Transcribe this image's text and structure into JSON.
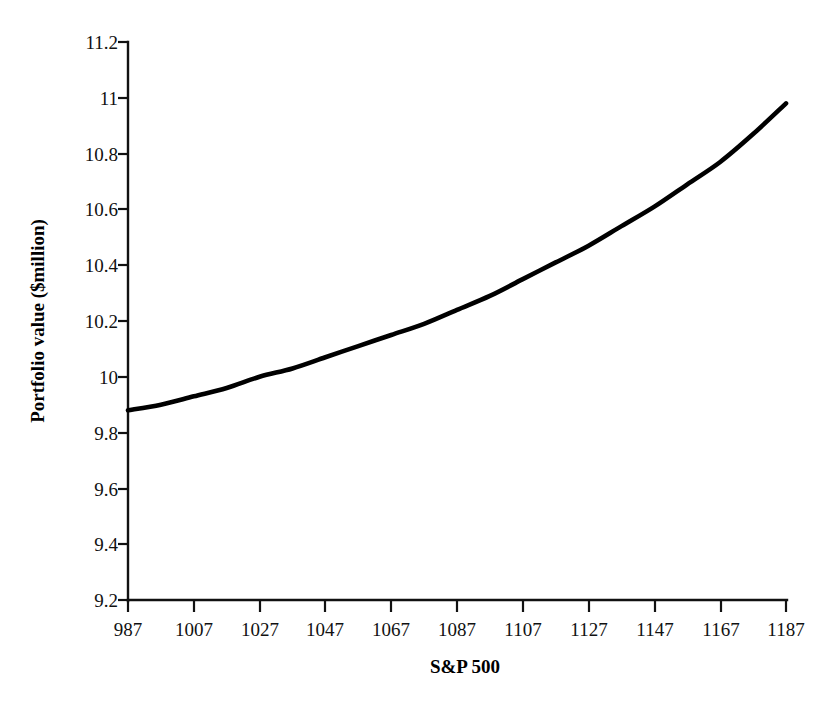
{
  "chart_data": {
    "type": "line",
    "title": "",
    "subtitle": "",
    "xlabel": "S&P 500",
    "ylabel": "Portfolio value ($million)",
    "xlim": [
      987,
      1187
    ],
    "ylim": [
      9.2,
      11.2
    ],
    "grid": false,
    "legend": false,
    "legend_position": "none",
    "xticks": [
      987,
      1007,
      1027,
      1047,
      1067,
      1087,
      1107,
      1127,
      1147,
      1167,
      1187
    ],
    "xtick_labels": [
      "987",
      "1007",
      "1027",
      "1047",
      "1067",
      "1087",
      "1107",
      "1127",
      "1147",
      "1167",
      "1187"
    ],
    "yticks": [
      9.2,
      9.4,
      9.6,
      9.8,
      10,
      10.2,
      10.4,
      10.6,
      10.8,
      11,
      11.2
    ],
    "ytick_labels": [
      "9.2",
      "9.4",
      "9.6",
      "9.8",
      "10",
      "10.2",
      "10.4",
      "10.6",
      "10.8",
      "11",
      "11.2"
    ],
    "series": [
      {
        "name": "Portfolio value",
        "color": "#000000",
        "x": [
          987,
          997,
          1007,
          1017,
          1027,
          1037,
          1047,
          1057,
          1067,
          1077,
          1087,
          1097,
          1107,
          1117,
          1127,
          1137,
          1147,
          1157,
          1167,
          1177,
          1187
        ],
        "values": [
          9.88,
          9.9,
          9.93,
          9.96,
          10.0,
          10.03,
          10.07,
          10.11,
          10.15,
          10.19,
          10.24,
          10.29,
          10.35,
          10.41,
          10.47,
          10.54,
          10.61,
          10.69,
          10.77,
          10.87,
          10.98
        ]
      }
    ]
  },
  "axes": {
    "x_title": "S&P 500",
    "y_title": "Portfolio value ($million)"
  }
}
